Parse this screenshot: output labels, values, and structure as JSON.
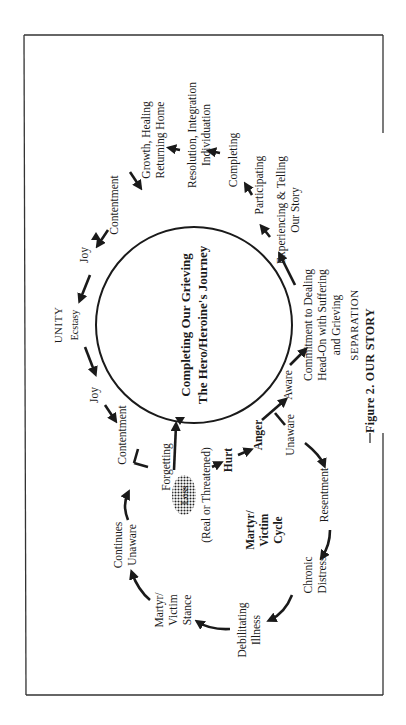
{
  "figure": {
    "caption": "Figure 2. OUR STORY",
    "top_region_label": "UNITY",
    "bottom_region_label": "SEPARATION",
    "orientation": "rotated 90° counter-clockwise",
    "center": {
      "line1": "Completing Our Grieving",
      "line2": "The Hero/Heroine's Journey"
    },
    "loss": {
      "label": "Loss",
      "sub": "(Real or Threatened)",
      "before": "Forgetting"
    },
    "unity_path": [
      "Contentment",
      "Joy",
      "Ecstasy",
      "Joy",
      "Contentment"
    ],
    "hurt_path": [
      "Hurt",
      "Anger",
      "Aware",
      "Unaware"
    ],
    "healing_path": {
      "commitment": [
        "Commitment to Dealing",
        "Head-On with Suffering",
        "and Grieving"
      ],
      "experiencing": [
        "Experiencing & Telling",
        "Our Story"
      ],
      "participating": "Participating",
      "completing": "Completing",
      "resolution": [
        "Resolution, Integration",
        "Individuation"
      ],
      "growth": [
        "Growth, Healing",
        "Returning Home"
      ]
    },
    "martyr_cycle": {
      "title": [
        "Martyr/",
        "Victim",
        "Cycle"
      ],
      "resentment": "Resentment",
      "chronic": [
        "Chronic",
        "Distress"
      ],
      "illness": [
        "Debilitating",
        "Illness"
      ],
      "stance": [
        "Martyr/",
        "Victim",
        "Stance"
      ],
      "continues": [
        "Continues",
        "Unaware"
      ]
    }
  }
}
